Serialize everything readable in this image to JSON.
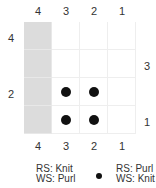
{
  "chart": {
    "top_column_labels": [
      "4",
      "3",
      "2",
      "1"
    ],
    "bottom_column_labels": [
      "4",
      "3",
      "2",
      "1"
    ],
    "left_row_labels": [
      {
        "label": "4",
        "row": 0
      },
      {
        "label": "2",
        "row": 2
      }
    ],
    "right_row_labels": [
      {
        "label": "3",
        "row": 1
      },
      {
        "label": "1",
        "row": 3
      }
    ],
    "shaded_column": 0,
    "dots": [
      {
        "row": 2,
        "col": 1
      },
      {
        "row": 2,
        "col": 2
      },
      {
        "row": 3,
        "col": 1
      },
      {
        "row": 3,
        "col": 2
      }
    ],
    "colors": {
      "shaded": "#dcdcdc",
      "dot": "#111111",
      "grid": "#eeeeee"
    }
  },
  "legend": {
    "blank": {
      "line1": "RS: Knit",
      "line2": "WS: Purl"
    },
    "dot": {
      "line1": "RS: Purl",
      "line2": "WS: Knit"
    }
  }
}
